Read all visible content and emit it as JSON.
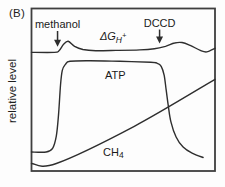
{
  "panel_label": "(B)",
  "colors": {
    "background": "#fdfdfd",
    "line": "#2e2e2e",
    "box": "#3f3f3f",
    "text": "#1a1a1a"
  },
  "chart_data": {
    "type": "line",
    "title": "",
    "xlabel": "",
    "ylabel": "relative level",
    "xlim": [
      0,
      100
    ],
    "ylim": [
      0,
      100
    ],
    "grid": false,
    "legend_position": "inline-labels",
    "series": [
      {
        "name": "delta-G-H-plus",
        "label": {
          "parts": [
            {
              "role": "main",
              "text": "ΔG"
            },
            {
              "role": "sub",
              "text": "H"
            },
            {
              "role": "sup",
              "text": "+"
            }
          ],
          "italic": true,
          "pos": {
            "x": 37.3,
            "y": 80.6
          }
        },
        "points": [
          [
            0,
            73
          ],
          [
            12.5,
            73
          ],
          [
            15,
            74
          ],
          [
            17.5,
            78
          ],
          [
            20,
            79.8
          ],
          [
            23.5,
            76.7
          ],
          [
            28,
            74.8
          ],
          [
            35,
            74
          ],
          [
            46,
            74.2
          ],
          [
            59,
            74.5
          ],
          [
            67,
            75.2
          ],
          [
            73,
            76.7
          ],
          [
            78,
            78.8
          ],
          [
            82,
            79.1
          ],
          [
            86.5,
            77.3
          ],
          [
            92,
            74.2
          ],
          [
            95.5,
            73.3
          ],
          [
            100,
            75.5
          ]
        ]
      },
      {
        "name": "ATP",
        "label": {
          "parts": [
            {
              "role": "main",
              "text": "ATP"
            }
          ],
          "italic": false,
          "pos": {
            "x": 40.1,
            "y": 56.9
          }
        },
        "points": [
          [
            0,
            11.7
          ],
          [
            8,
            11.7
          ],
          [
            11.5,
            14
          ],
          [
            13.5,
            21.5
          ],
          [
            14.7,
            34.4
          ],
          [
            15.8,
            52.8
          ],
          [
            16.8,
            62
          ],
          [
            18.5,
            65.6
          ],
          [
            21,
            67.5
          ],
          [
            32,
            67.8
          ],
          [
            48,
            67.5
          ],
          [
            65,
            66.9
          ],
          [
            68.5,
            66.3
          ],
          [
            70.7,
            64.4
          ],
          [
            72.3,
            58.9
          ],
          [
            73.4,
            49.7
          ],
          [
            74.5,
            40.5
          ],
          [
            76,
            30.1
          ],
          [
            78.8,
            20.9
          ],
          [
            82.6,
            14.7
          ],
          [
            87.5,
            11
          ],
          [
            93.5,
            8.3
          ]
        ]
      },
      {
        "name": "CH4",
        "label": {
          "parts": [
            {
              "role": "main",
              "text": "CH"
            },
            {
              "role": "sub",
              "text": "4"
            }
          ],
          "italic": false,
          "pos": {
            "x": 39.0,
            "y": 9.5
          }
        },
        "points": [
          [
            0,
            4.6
          ],
          [
            13.5,
            4.6
          ],
          [
            56,
            27.5
          ],
          [
            100,
            56.4
          ]
        ]
      }
    ],
    "annotations": [
      {
        "label": "methanol",
        "x": 14.2,
        "label_y": 88.0,
        "arrow_tip_y": 76.4
      },
      {
        "label": "DCCD",
        "x": 69.8,
        "label_y": 88.9,
        "arrow_tip_y": 78.5
      }
    ]
  }
}
